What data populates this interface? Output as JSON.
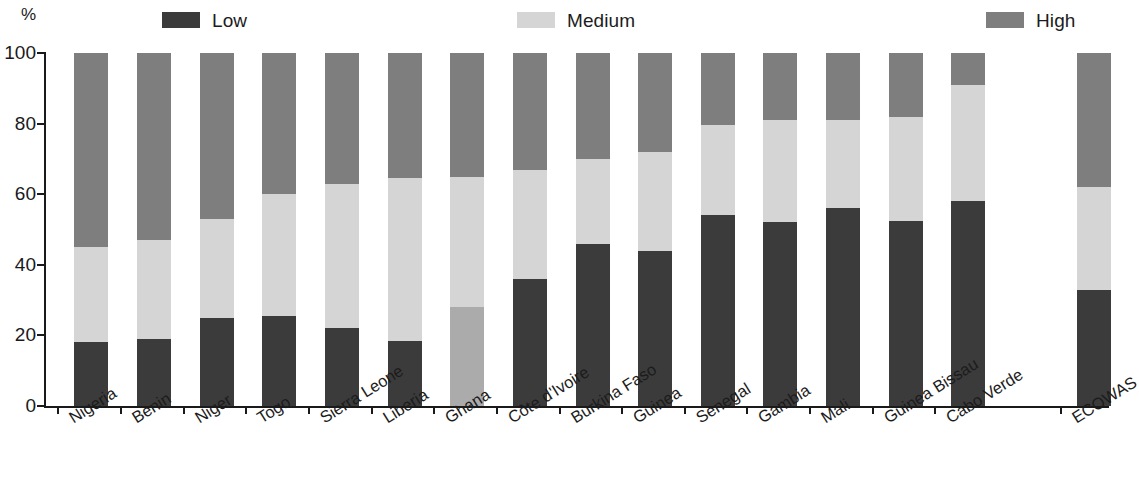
{
  "legend": {
    "items": [
      {
        "label": "Low",
        "color": "#3b3b3b",
        "key": "low"
      },
      {
        "label": "Medium",
        "color": "#d5d5d5",
        "key": "medium"
      },
      {
        "label": "High",
        "color": "#7e7e7e",
        "key": "high"
      }
    ]
  },
  "axes": {
    "y_unit": "%",
    "y_ticks": [
      "0",
      "20",
      "40",
      "60",
      "80",
      "100"
    ]
  },
  "chart_data": {
    "type": "bar",
    "subtype": "stacked-bar-100",
    "title": "",
    "subtitle": "",
    "xlabel": "",
    "ylabel": "%",
    "ylim": [
      0,
      100
    ],
    "ytick_values": [
      0,
      20,
      40,
      60,
      80,
      100
    ],
    "grid": false,
    "legend_position": "top",
    "stacked": true,
    "categories": [
      "Nigeria",
      "Benin",
      "Niger",
      "Togo",
      "Sierra Leone",
      "Liberia",
      "Ghana",
      "Côte d'Ivoire",
      "Burkina Faso",
      "Guinea",
      "Senegal",
      "Gambia",
      "Mali",
      "Guinea Bissau",
      "Cabo Verde",
      "ECOWAS"
    ],
    "series": [
      {
        "name": "Low",
        "color": "#3b3b3b",
        "values": [
          18,
          19,
          25,
          25.5,
          22,
          18.5,
          0,
          36,
          46,
          44,
          54,
          52,
          56,
          52.5,
          58,
          33
        ]
      },
      {
        "name": "Medium",
        "color": "#d5d5d5",
        "values": [
          27,
          28,
          28,
          34.5,
          41,
          46,
          65,
          31,
          24,
          28,
          25.5,
          29,
          25,
          29.5,
          33,
          29
        ]
      },
      {
        "name": "High",
        "color": "#7e7e7e",
        "values": [
          55,
          53,
          47,
          40,
          37,
          35.5,
          35,
          33,
          30,
          28,
          20.5,
          19,
          19,
          18,
          9,
          38
        ]
      }
    ]
  },
  "ghana_override": {
    "index": 6,
    "bottom_band_color": "#ababab",
    "bottom_band_value": 28,
    "medium_value": 37,
    "high_value": 35
  },
  "layout": {
    "gap_before_last": true
  }
}
